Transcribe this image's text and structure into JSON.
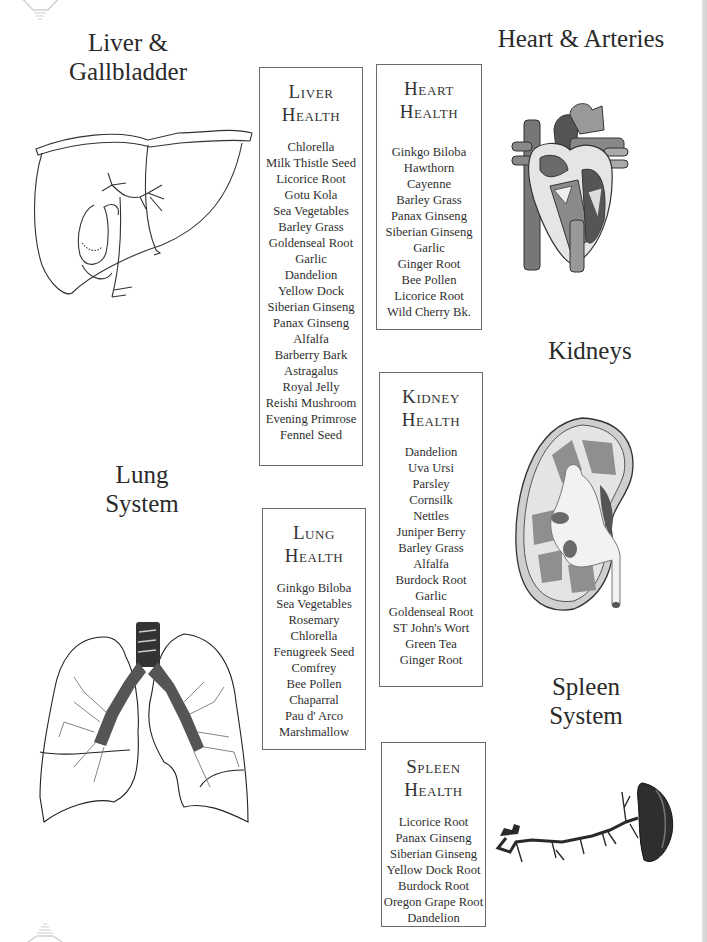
{
  "sections": {
    "liver": {
      "title_line1": "Liver &",
      "title_line2": "Gallbladder"
    },
    "heart": {
      "title": "Heart & Arteries"
    },
    "kidney": {
      "title": "Kidneys"
    },
    "lung": {
      "title_line1": "Lung",
      "title_line2": "System"
    },
    "spleen": {
      "title_line1": "Spleen",
      "title_line2": "System"
    }
  },
  "boxes": {
    "liver": {
      "heading_line1": "Liver",
      "heading_line2": "Health",
      "herbs": [
        "Chlorella",
        "Milk Thistle Seed",
        "Licorice Root",
        "Gotu Kola",
        "Sea Vegetables",
        "Barley Grass",
        "Goldenseal Root",
        "Garlic",
        "Dandelion",
        "Yellow Dock",
        "Siberian Ginseng",
        "Panax Ginseng",
        "Alfalfa",
        "Barberry Bark",
        "Astragalus",
        "Royal Jelly",
        "Reishi Mushroom",
        "Evening Primrose",
        "Fennel Seed"
      ]
    },
    "heart": {
      "heading_line1": "Heart",
      "heading_line2": "Health",
      "herbs": [
        "Ginkgo Biloba",
        "Hawthorn",
        "Cayenne",
        "Barley Grass",
        "Panax Ginseng",
        "Siberian Ginseng",
        "Garlic",
        "Ginger Root",
        "Bee Pollen",
        "Licorice Root",
        "Wild Cherry Bk."
      ]
    },
    "kidney": {
      "heading_line1": "Kidney",
      "heading_line2": "Health",
      "herbs": [
        "Dandelion",
        "Uva Ursi",
        "Parsley",
        "Cornsilk",
        "Nettles",
        "Juniper Berry",
        "Barley Grass",
        "Alfalfa",
        "Burdock Root",
        "Garlic",
        "Goldenseal Root",
        "ST John's Wort",
        "Green Tea",
        "Ginger Root"
      ]
    },
    "lung": {
      "heading_line1": "Lung",
      "heading_line2": "Health",
      "herbs": [
        "Ginkgo Biloba",
        "Sea Vegetables",
        "Rosemary",
        "Chlorella",
        "Fenugreek Seed",
        "Comfrey",
        "Bee Pollen",
        "Chaparral",
        "Pau d' Arco",
        "Marshmallow"
      ]
    },
    "spleen": {
      "heading_line1": "Spleen",
      "heading_line2": "Health",
      "herbs": [
        "Licorice Root",
        "Panax Ginseng",
        "Siberian Ginseng",
        "Yellow Dock Root",
        "Burdock Root",
        "Oregon Grape Root",
        "Dandelion"
      ]
    }
  },
  "illustrations": {
    "liver": "liver-gallbladder-illustration",
    "heart": "heart-cross-section-illustration",
    "kidney": "kidney-cross-section-illustration",
    "lung": "lungs-bronchi-illustration",
    "spleen": "spleen-vessels-illustration"
  },
  "colors": {
    "text": "#2b2b2b",
    "box_border": "#6a6a6a",
    "background": "#ffffff"
  }
}
